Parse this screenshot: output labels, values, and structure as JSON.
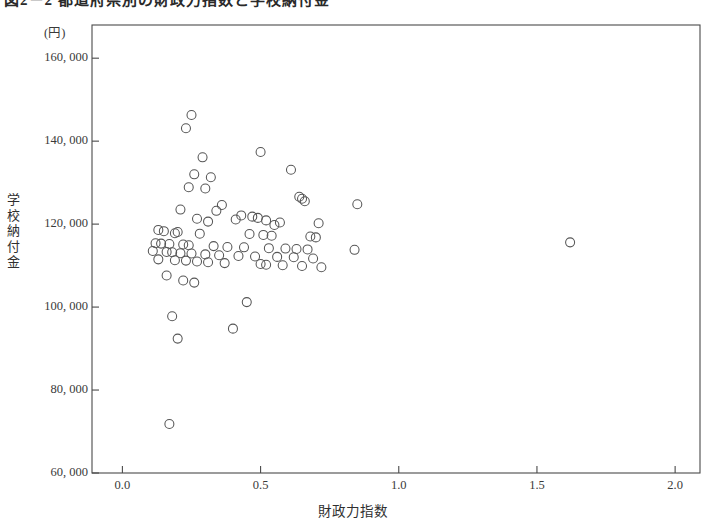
{
  "figure": {
    "title": "図2－2 都道府県別の財政力指数と学校納付金",
    "y_unit_note": "(円)",
    "y_axis_title_chars": [
      "学",
      "校",
      "納",
      "付",
      "金"
    ],
    "x_axis_title": "財政力指数"
  },
  "chart_data": {
    "type": "scatter",
    "title": "図2－2 都道府県別の財政力指数と学校納付金",
    "xlabel": "財政力指数",
    "ylabel": "学校納付金",
    "y_unit": "(円)",
    "xlim": [
      -0.11,
      2.09
    ],
    "ylim": [
      60000,
      168000
    ],
    "xticks": [
      0.0,
      0.5,
      1.0,
      1.5,
      2.0
    ],
    "xtick_labels": [
      "0.0",
      "0.5",
      "1.0",
      "1.5",
      "2.0"
    ],
    "yticks": [
      60000,
      80000,
      100000,
      120000,
      140000,
      160000
    ],
    "ytick_labels": [
      "60, 000",
      "80, 000",
      "100, 000",
      "120, 000",
      "140, 000",
      "160, 000"
    ],
    "grid": false,
    "legend": false,
    "marker": "open-circle",
    "marker_color": "#555555",
    "marker_size_px": 9,
    "n_points": 80,
    "points": [
      [
        0.25,
        146300
      ],
      [
        0.23,
        143100
      ],
      [
        0.5,
        137400
      ],
      [
        0.29,
        136100
      ],
      [
        0.61,
        133100
      ],
      [
        0.26,
        132000
      ],
      [
        0.32,
        131300
      ],
      [
        0.24,
        128900
      ],
      [
        0.3,
        128600
      ],
      [
        0.64,
        126600
      ],
      [
        0.65,
        126100
      ],
      [
        0.66,
        125500
      ],
      [
        0.85,
        124800
      ],
      [
        0.36,
        124600
      ],
      [
        0.21,
        123500
      ],
      [
        0.34,
        123200
      ],
      [
        0.43,
        122100
      ],
      [
        0.47,
        121800
      ],
      [
        0.49,
        121500
      ],
      [
        0.27,
        121300
      ],
      [
        0.41,
        121100
      ],
      [
        0.52,
        120900
      ],
      [
        0.31,
        120600
      ],
      [
        0.57,
        120400
      ],
      [
        0.71,
        120200
      ],
      [
        0.55,
        119800
      ],
      [
        0.13,
        118600
      ],
      [
        0.15,
        118300
      ],
      [
        0.2,
        118100
      ],
      [
        0.19,
        117800
      ],
      [
        0.28,
        117700
      ],
      [
        0.46,
        117600
      ],
      [
        0.51,
        117400
      ],
      [
        0.54,
        117200
      ],
      [
        0.68,
        117000
      ],
      [
        0.7,
        116800
      ],
      [
        1.62,
        115600
      ],
      [
        0.12,
        115400
      ],
      [
        0.14,
        115300
      ],
      [
        0.17,
        115200
      ],
      [
        0.22,
        115100
      ],
      [
        0.24,
        114900
      ],
      [
        0.33,
        114700
      ],
      [
        0.38,
        114500
      ],
      [
        0.44,
        114400
      ],
      [
        0.53,
        114200
      ],
      [
        0.59,
        114100
      ],
      [
        0.63,
        114000
      ],
      [
        0.67,
        113900
      ],
      [
        0.84,
        113800
      ],
      [
        0.11,
        113500
      ],
      [
        0.16,
        113300
      ],
      [
        0.18,
        113200
      ],
      [
        0.21,
        113000
      ],
      [
        0.25,
        112900
      ],
      [
        0.3,
        112700
      ],
      [
        0.35,
        112500
      ],
      [
        0.42,
        112300
      ],
      [
        0.48,
        112200
      ],
      [
        0.56,
        112100
      ],
      [
        0.62,
        112000
      ],
      [
        0.69,
        111700
      ],
      [
        0.13,
        111500
      ],
      [
        0.19,
        111300
      ],
      [
        0.23,
        111200
      ],
      [
        0.27,
        111000
      ],
      [
        0.31,
        110800
      ],
      [
        0.37,
        110600
      ],
      [
        0.5,
        110400
      ],
      [
        0.52,
        110200
      ],
      [
        0.58,
        110100
      ],
      [
        0.65,
        109900
      ],
      [
        0.72,
        109600
      ],
      [
        0.16,
        107600
      ],
      [
        0.22,
        106400
      ],
      [
        0.26,
        105900
      ],
      [
        0.45,
        101200
      ],
      [
        0.18,
        97800
      ],
      [
        0.4,
        94800
      ],
      [
        0.2,
        92400
      ],
      [
        0.17,
        71800
      ]
    ]
  }
}
